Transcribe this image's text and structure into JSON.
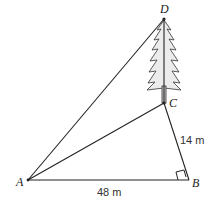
{
  "diagram": {
    "type": "geometry-figure",
    "points": {
      "A": {
        "label": "A",
        "x": 28,
        "y": 180
      },
      "B": {
        "label": "B",
        "x": 189,
        "y": 180
      },
      "C": {
        "label": "C",
        "x": 164,
        "y": 103
      },
      "D": {
        "label": "D",
        "x": 164,
        "y": 19
      }
    },
    "segments": [
      {
        "from": "A",
        "to": "B"
      },
      {
        "from": "B",
        "to": "C"
      },
      {
        "from": "C",
        "to": "D"
      },
      {
        "from": "A",
        "to": "C"
      },
      {
        "from": "A",
        "to": "D"
      }
    ],
    "measurements": {
      "AB": "48 m",
      "BC": "14 m"
    },
    "right_angle_at": "B",
    "object": "tree (CD)",
    "colors": {
      "line": "#222222",
      "tree_fill": "#e6e6e6",
      "background": "#ffffff"
    }
  }
}
